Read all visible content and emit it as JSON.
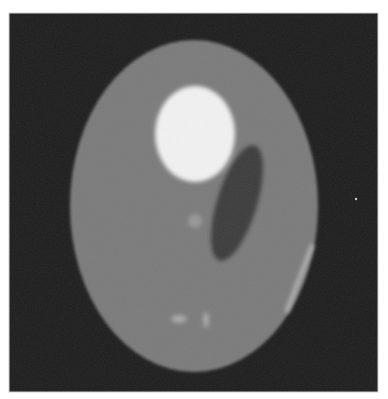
{
  "image": {
    "description": "Grayscale tomographic phantom image (Shepp-Logan style)",
    "width": 388,
    "height": 399,
    "frame": {
      "x": 9,
      "y": 13,
      "width": 369,
      "height": 379
    },
    "colors": {
      "page_background": "#ffffff",
      "frame_border": "#cfcfcf",
      "background": "#1c1c1c",
      "outer_ellipse": "#7a7a7a",
      "bright_ellipse": "#f2f2f2",
      "dark_ellipse": "#3a3a3a",
      "small_dot": "#979797",
      "bottom_spots": "#a8a8a8",
      "edge_streak": "#b8b8b8",
      "speck": "#cccccc"
    },
    "shapes": {
      "outer_ellipse": {
        "cx": 194,
        "cy": 206,
        "rx": 124,
        "ry": 166,
        "rotate": 0
      },
      "bright_ellipse": {
        "cx": 195,
        "cy": 134,
        "rx": 40,
        "ry": 48,
        "rotate": 0
      },
      "dark_ellipse": {
        "cx": 237,
        "cy": 203,
        "rx": 20,
        "ry": 60,
        "rotate": 17
      },
      "small_dot": {
        "cx": 195,
        "cy": 221,
        "r": 7
      },
      "bottom_spot_left": {
        "cx": 179,
        "cy": 319,
        "rx": 8,
        "ry": 4
      },
      "bottom_spot_right": {
        "cx": 206,
        "cy": 320,
        "rx": 3,
        "ry": 8
      },
      "edge_streak": {
        "x1": 312,
        "y1": 246,
        "x2": 287,
        "y2": 311,
        "width": 4
      },
      "speck": {
        "cx": 356,
        "cy": 199,
        "r": 1.2
      }
    }
  }
}
